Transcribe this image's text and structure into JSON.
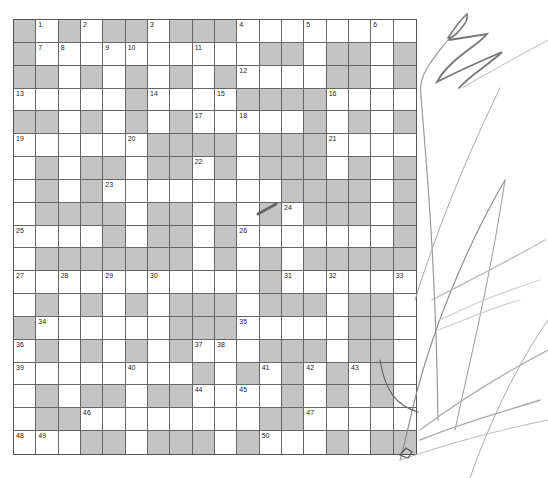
{
  "puzzle": {
    "rows": 19,
    "cols": 18,
    "colors": {
      "block": "#c4c4c4",
      "open": "#ffffff",
      "line": "#666666"
    },
    "grid": [
      "B1B2BB3BBB4..5..6.",
      "B78.90..1..BB.BB.B",
      "BB.B.B.B.B2...BB.B",
      "3....B4..5BBBB6...",
      "BB.B.B.B7.8..B.B.B",
      "9....0BBBB.BBB1...",
      ".B.BB.BB2B.BBB.B.B",
      ".B.B3.......BBBB.B",
      ".BBBB.BB.B.B4BBB.B",
      "5...B.BB.B6......B",
      ".BBBBBBB.B.B.BBBBB",
      "7.8.9.0....B1.2..3",
      ".B.B.B.BBB.BBB.BB.",
      "B4.....BBB5....BB.",
      "6B.B.B.B78.BBB.BB.",
      "9....0..B.B1B2B3B.",
      ".B.BB.BB4.5.B.B.B.",
      ".BB6.......BB7....",
      "89.BB.BBB.B0..B.BB"
    ],
    "numbers": [
      {
        "r": 0,
        "c": 1,
        "n": "1"
      },
      {
        "r": 0,
        "c": 3,
        "n": "2"
      },
      {
        "r": 0,
        "c": 6,
        "n": "3"
      },
      {
        "r": 0,
        "c": 10,
        "n": "4"
      },
      {
        "r": 0,
        "c": 13,
        "n": "5"
      },
      {
        "r": 0,
        "c": 16,
        "n": "6"
      },
      {
        "r": 1,
        "c": 1,
        "n": "7"
      },
      {
        "r": 1,
        "c": 2,
        "n": "8"
      },
      {
        "r": 1,
        "c": 4,
        "n": "9"
      },
      {
        "r": 1,
        "c": 5,
        "n": "10"
      },
      {
        "r": 1,
        "c": 8,
        "n": "11"
      },
      {
        "r": 2,
        "c": 10,
        "n": "12"
      },
      {
        "r": 3,
        "c": 0,
        "n": "13"
      },
      {
        "r": 3,
        "c": 6,
        "n": "14"
      },
      {
        "r": 3,
        "c": 9,
        "n": "15"
      },
      {
        "r": 3,
        "c": 14,
        "n": "16"
      },
      {
        "r": 4,
        "c": 8,
        "n": "17"
      },
      {
        "r": 4,
        "c": 10,
        "n": "18"
      },
      {
        "r": 5,
        "c": 0,
        "n": "19"
      },
      {
        "r": 5,
        "c": 5,
        "n": "20"
      },
      {
        "r": 5,
        "c": 14,
        "n": "21"
      },
      {
        "r": 6,
        "c": 8,
        "n": "22"
      },
      {
        "r": 7,
        "c": 4,
        "n": "23"
      },
      {
        "r": 8,
        "c": 12,
        "n": "24"
      },
      {
        "r": 9,
        "c": 0,
        "n": "25"
      },
      {
        "r": 9,
        "c": 10,
        "n": "26"
      },
      {
        "r": 11,
        "c": 0,
        "n": "27"
      },
      {
        "r": 11,
        "c": 2,
        "n": "28"
      },
      {
        "r": 11,
        "c": 4,
        "n": "29"
      },
      {
        "r": 11,
        "c": 6,
        "n": "30"
      },
      {
        "r": 11,
        "c": 12,
        "n": "31"
      },
      {
        "r": 11,
        "c": 14,
        "n": "32"
      },
      {
        "r": 11,
        "c": 17,
        "n": "33"
      },
      {
        "r": 13,
        "c": 1,
        "n": "34"
      },
      {
        "r": 13,
        "c": 10,
        "n": "35"
      },
      {
        "r": 14,
        "c": 0,
        "n": "36"
      },
      {
        "r": 14,
        "c": 8,
        "n": "37"
      },
      {
        "r": 14,
        "c": 9,
        "n": "38"
      },
      {
        "r": 15,
        "c": 0,
        "n": "39"
      },
      {
        "r": 15,
        "c": 5,
        "n": "40"
      },
      {
        "r": 15,
        "c": 11,
        "n": "41"
      },
      {
        "r": 15,
        "c": 13,
        "n": "42"
      },
      {
        "r": 15,
        "c": 15,
        "n": "43"
      },
      {
        "r": 16,
        "c": 8,
        "n": "44"
      },
      {
        "r": 16,
        "c": 10,
        "n": "45"
      },
      {
        "r": 17,
        "c": 3,
        "n": "46"
      },
      {
        "r": 17,
        "c": 13,
        "n": "47"
      },
      {
        "r": 18,
        "c": 0,
        "n": "48"
      },
      {
        "r": 18,
        "c": 1,
        "n": "49"
      },
      {
        "r": 18,
        "c": 11,
        "n": "50"
      }
    ]
  }
}
